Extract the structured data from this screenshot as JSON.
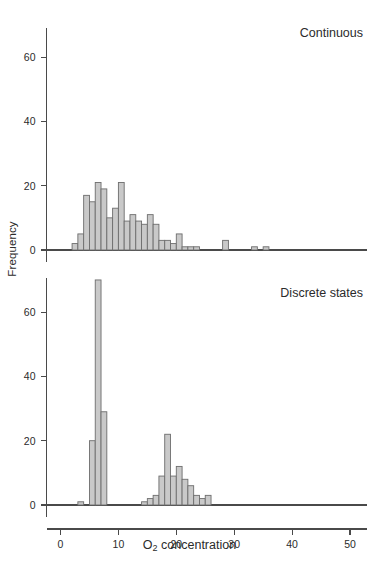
{
  "figure": {
    "axis_title_x_main": "O",
    "axis_title_x_sub": "2",
    "axis_title_x_rest": " concentration",
    "axis_title_y": "Frequency",
    "bar_fill_color": "#c9c9c9",
    "bar_stroke_color": "#6d6d6d",
    "axis_color": "#4a4a4a"
  },
  "panels": [
    {
      "label": "Continuous"
    },
    {
      "label": "Discrete states"
    }
  ],
  "chart_data": [
    {
      "type": "bar",
      "title": "Continuous",
      "xlabel": "O2 concentration",
      "ylabel": "Frequency",
      "xlim": [
        0,
        52
      ],
      "ylim": [
        0,
        72
      ],
      "xticks": [
        0,
        10,
        20,
        30,
        40,
        50
      ],
      "yticks": [
        0,
        20,
        40,
        60
      ],
      "xtick_labels": [
        "0",
        "10",
        "20",
        "30",
        "40",
        "50"
      ],
      "ytick_labels": [
        "0",
        "20",
        "40",
        "60"
      ],
      "grid": false,
      "legend": "none",
      "bin_width": 1,
      "bins": [
        {
          "x": 2,
          "value": 2
        },
        {
          "x": 3,
          "value": 5
        },
        {
          "x": 4,
          "value": 17
        },
        {
          "x": 5,
          "value": 15
        },
        {
          "x": 6,
          "value": 21
        },
        {
          "x": 7,
          "value": 19
        },
        {
          "x": 8,
          "value": 10
        },
        {
          "x": 9,
          "value": 13
        },
        {
          "x": 10,
          "value": 21
        },
        {
          "x": 11,
          "value": 9
        },
        {
          "x": 12,
          "value": 11
        },
        {
          "x": 13,
          "value": 9
        },
        {
          "x": 14,
          "value": 8
        },
        {
          "x": 15,
          "value": 11
        },
        {
          "x": 16,
          "value": 8
        },
        {
          "x": 17,
          "value": 3
        },
        {
          "x": 18,
          "value": 3
        },
        {
          "x": 19,
          "value": 2
        },
        {
          "x": 20,
          "value": 5
        },
        {
          "x": 21,
          "value": 1
        },
        {
          "x": 22,
          "value": 1
        },
        {
          "x": 23,
          "value": 1
        },
        {
          "x": 28,
          "value": 3
        },
        {
          "x": 33,
          "value": 1
        },
        {
          "x": 35,
          "value": 1
        }
      ]
    },
    {
      "type": "bar",
      "title": "Discrete states",
      "xlabel": "O2 concentration",
      "ylabel": "Frequency",
      "xlim": [
        0,
        52
      ],
      "ylim": [
        0,
        72
      ],
      "xticks": [
        0,
        10,
        20,
        30,
        40,
        50
      ],
      "yticks": [
        0,
        20,
        40,
        60
      ],
      "xtick_labels": [
        "0",
        "10",
        "20",
        "30",
        "40",
        "50"
      ],
      "ytick_labels": [
        "0",
        "20",
        "40",
        "60"
      ],
      "grid": false,
      "legend": "none",
      "bin_width": 1,
      "bins": [
        {
          "x": 3,
          "value": 1
        },
        {
          "x": 5,
          "value": 20
        },
        {
          "x": 6,
          "value": 70
        },
        {
          "x": 7,
          "value": 29
        },
        {
          "x": 14,
          "value": 1
        },
        {
          "x": 15,
          "value": 2
        },
        {
          "x": 16,
          "value": 3
        },
        {
          "x": 17,
          "value": 9
        },
        {
          "x": 18,
          "value": 22
        },
        {
          "x": 19,
          "value": 9
        },
        {
          "x": 20,
          "value": 12
        },
        {
          "x": 21,
          "value": 8
        },
        {
          "x": 22,
          "value": 6
        },
        {
          "x": 23,
          "value": 3
        },
        {
          "x": 24,
          "value": 2
        },
        {
          "x": 25,
          "value": 3
        }
      ]
    }
  ]
}
